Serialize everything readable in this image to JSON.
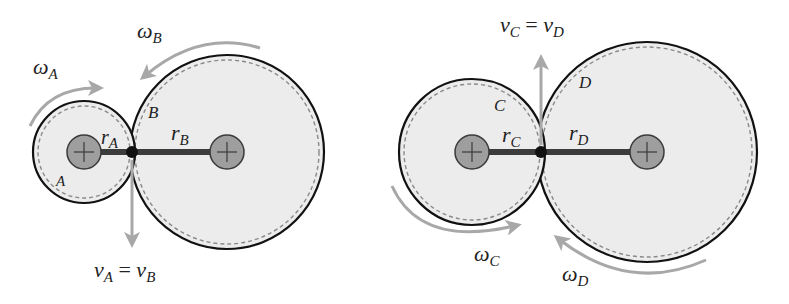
{
  "colors": {
    "gear_fill": "#ececec",
    "gear_stroke": "#111111",
    "pitch_dash": "#8a8a8a",
    "hub_fill": "#9e9e9e",
    "hub_stroke": "#3a3a3a",
    "arm": "#3c3c3c",
    "contact": "#111111",
    "arrow": "#a8a8a8",
    "text": "#222222"
  },
  "left_pair": {
    "gear_small": {
      "label": "A",
      "radius_label": {
        "base": "r",
        "sub": "A"
      },
      "omega_label": {
        "base": "ω",
        "sub": "A"
      },
      "rotation": "clockwise"
    },
    "gear_large": {
      "label": "B",
      "radius_label": {
        "base": "r",
        "sub": "B"
      },
      "omega_label": {
        "base": "ω",
        "sub": "B"
      },
      "rotation": "counterclockwise"
    },
    "velocity_label": {
      "left_base": "v",
      "left_sub": "A",
      "eq": " = ",
      "right_base": "v",
      "right_sub": "B"
    },
    "velocity_direction": "down"
  },
  "right_pair": {
    "gear_small": {
      "label": "C",
      "radius_label": {
        "base": "r",
        "sub": "C"
      },
      "omega_label": {
        "base": "ω",
        "sub": "C"
      },
      "rotation": "counterclockwise"
    },
    "gear_large": {
      "label": "D",
      "radius_label": {
        "base": "r",
        "sub": "D"
      },
      "omega_label": {
        "base": "ω",
        "sub": "D"
      },
      "rotation": "clockwise"
    },
    "velocity_label": {
      "left_base": "v",
      "left_sub": "C",
      "eq": " = ",
      "right_base": "v",
      "right_sub": "D"
    },
    "velocity_direction": "up"
  }
}
